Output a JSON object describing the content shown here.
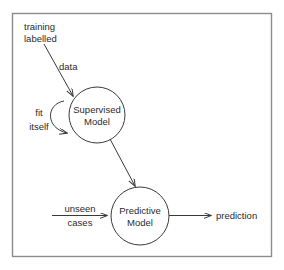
{
  "diagram": {
    "frame": {
      "name": "outer-frame",
      "color": "#8c8c8c"
    },
    "colors": {
      "line": "#3a3a3a",
      "text": "#2b2b2b",
      "frame": "#8c8c8c",
      "background": "#ffffff"
    },
    "nodes": [
      {
        "id": "supervised-model",
        "line1": "Supervised",
        "line2": "Model",
        "cx": 97,
        "cy": 115,
        "r": 28
      },
      {
        "id": "predictive-model",
        "line1": "Predictive",
        "line2": "Model",
        "cx": 140,
        "cy": 216,
        "r": 29
      }
    ],
    "labels": [
      {
        "id": "training-labelled",
        "line1": "training",
        "line2": "labelled",
        "x": 24,
        "y": 27
      },
      {
        "id": "data",
        "text": "data",
        "x": 59,
        "y": 66
      },
      {
        "id": "fit-itself",
        "line1": "fit",
        "line2": "itself",
        "x": 26,
        "y": 115
      },
      {
        "id": "unseen-cases",
        "line1": "unseen",
        "line2": "cases",
        "x": 54,
        "y": 211
      },
      {
        "id": "prediction",
        "text": "prediction",
        "x": 216,
        "y": 219
      }
    ],
    "edges": [
      {
        "id": "training-data-to-supervised",
        "from": "training labelled data",
        "to": "Supervised Model",
        "style": "straight-arrow"
      },
      {
        "id": "fit-itself-self-loop",
        "from": "Supervised Model",
        "to": "Supervised Model",
        "style": "curved-self-loop-arrow"
      },
      {
        "id": "supervised-to-predictive",
        "from": "Supervised Model",
        "to": "Predictive Model",
        "style": "straight-arrow"
      },
      {
        "id": "unseen-cases-to-predictive",
        "from": "unseen cases",
        "to": "Predictive Model",
        "style": "straight-arrow"
      },
      {
        "id": "predictive-to-prediction",
        "from": "Predictive Model",
        "to": "prediction",
        "style": "straight-arrow"
      }
    ]
  }
}
